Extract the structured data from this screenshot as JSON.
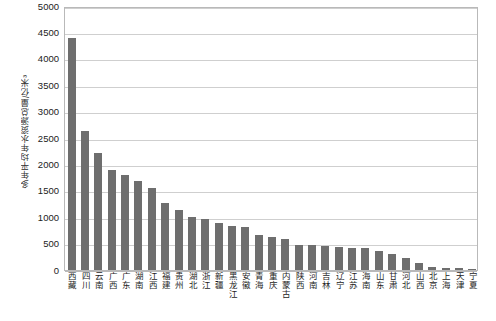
{
  "chart_data": {
    "type": "bar",
    "title": "",
    "subtitle": "",
    "xlabel": "",
    "ylabel": "多年平均年水资源总量/亿米³",
    "ylim": [
      0,
      5000
    ],
    "ytick_step": 500,
    "yticks": [
      "0",
      "500",
      "1000",
      "1500",
      "2000",
      "2500",
      "3000",
      "3500",
      "4000",
      "4500",
      "5000"
    ],
    "grid": true,
    "legend": false,
    "legend_position": "none",
    "bar_color": "#6e6e6e",
    "categories": [
      "西藏",
      "四川",
      "云南",
      "广西",
      "广东",
      "湖南",
      "江西",
      "福建",
      "贵州",
      "湖北",
      "浙江",
      "新疆",
      "黑龙江",
      "安徽",
      "青海",
      "重庆",
      "内蒙古",
      "陕西",
      "河南",
      "吉林",
      "辽宁",
      "江苏",
      "海南",
      "山东",
      "甘肃",
      "河北",
      "山西",
      "北京",
      "上海",
      "天津",
      "宁夏"
    ],
    "values": [
      4390,
      2620,
      2200,
      1880,
      1790,
      1680,
      1550,
      1260,
      1120,
      1000,
      960,
      880,
      830,
      800,
      660,
      620,
      580,
      470,
      460,
      440,
      420,
      410,
      400,
      360,
      300,
      210,
      130,
      40,
      30,
      20,
      10
    ]
  }
}
